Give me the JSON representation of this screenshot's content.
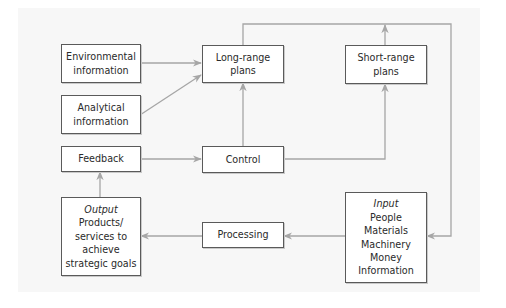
{
  "diagram": {
    "boxes": {
      "environmental": {
        "lines": [
          "Environmental",
          "information"
        ]
      },
      "analytical": {
        "lines": [
          "Analytical",
          "information"
        ]
      },
      "feedback": {
        "label": "Feedback"
      },
      "output": {
        "heading": "Output",
        "lines": [
          "Products/",
          "services to",
          "achieve",
          "strategic goals"
        ]
      },
      "long_range": {
        "lines": [
          "Long-range",
          "plans"
        ]
      },
      "control": {
        "label": "Control"
      },
      "processing": {
        "label": "Processing"
      },
      "short_range": {
        "lines": [
          "Short-range",
          "plans"
        ]
      },
      "input": {
        "heading": "Input",
        "lines": [
          "People",
          "Materials",
          "Machinery",
          "Money",
          "Information"
        ]
      }
    },
    "edges": [
      {
        "from": "Environmental information",
        "to": "Long-range plans"
      },
      {
        "from": "Analytical information",
        "to": "Long-range plans"
      },
      {
        "from": "Control",
        "to": "Long-range plans"
      },
      {
        "from": "Feedback",
        "to": "Control"
      },
      {
        "from": "Control",
        "to": "Short-range plans"
      },
      {
        "from": "Short-range plans",
        "to": "top loop"
      },
      {
        "from": "Long-range plans",
        "to": "Input (via top loop)"
      },
      {
        "from": "Input",
        "to": "Processing"
      },
      {
        "from": "Processing",
        "to": "Output"
      },
      {
        "from": "Output",
        "to": "Feedback"
      }
    ],
    "colors": {
      "border": "#5a5a5a",
      "connector": "#a6a6a6",
      "text": "#2a2a2a",
      "panel": "#f7f7f7"
    }
  }
}
